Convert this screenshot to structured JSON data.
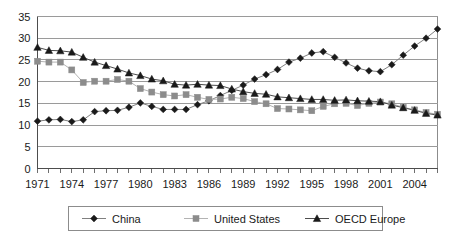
{
  "chart_data": {
    "type": "line",
    "title": "",
    "xlabel": "",
    "ylabel": "",
    "xlim": [
      1971,
      2006
    ],
    "ylim": [
      0,
      35
    ],
    "yticks": [
      0,
      5,
      10,
      15,
      20,
      25,
      30,
      35
    ],
    "xticks_major": [
      1971,
      1974,
      1977,
      1980,
      1983,
      1986,
      1989,
      1992,
      1995,
      1998,
      2001,
      2004
    ],
    "grid": "horizontal",
    "legend_position": "bottom",
    "x": [
      1971,
      1972,
      1973,
      1974,
      1975,
      1976,
      1977,
      1978,
      1979,
      1980,
      1981,
      1982,
      1983,
      1984,
      1985,
      1986,
      1987,
      1988,
      1989,
      1990,
      1991,
      1992,
      1993,
      1994,
      1995,
      1996,
      1997,
      1998,
      1999,
      2000,
      2001,
      2002,
      2003,
      2004,
      2005,
      2006
    ],
    "series": [
      {
        "name": "China",
        "marker": "diamond",
        "color": "#1a1a1a",
        "line_color": "#808080",
        "values": [
          10.9,
          11.2,
          11.3,
          10.8,
          11.2,
          13.1,
          13.3,
          13.4,
          14.1,
          15.1,
          14.3,
          13.6,
          13.6,
          13.6,
          14.7,
          15.6,
          16.8,
          18.0,
          19.2,
          20.6,
          21.6,
          22.8,
          24.5,
          25.4,
          26.6,
          26.9,
          25.6,
          24.3,
          23.1,
          22.5,
          22.3,
          23.9,
          26.1,
          28.2,
          30.0,
          32.1
        ]
      },
      {
        "name": "United States",
        "marker": "square",
        "color": "#8c8c8c",
        "line_color": "#b3b3b3",
        "values": [
          24.7,
          24.5,
          24.5,
          22.7,
          19.8,
          20.1,
          20.1,
          20.5,
          20.1,
          18.4,
          17.6,
          17.0,
          16.7,
          17.0,
          16.4,
          15.9,
          16.0,
          16.4,
          16.1,
          15.4,
          14.9,
          13.8,
          13.7,
          13.5,
          13.3,
          14.3,
          14.9,
          15.0,
          14.5,
          15.0,
          15.3,
          14.9,
          14.1,
          13.5,
          12.9,
          12.5
        ]
      },
      {
        "name": "OECD Europe",
        "marker": "triangle",
        "color": "#1a1a1a",
        "line_color": "#4d4d4d",
        "values": [
          27.9,
          27.2,
          27.1,
          26.8,
          25.6,
          24.5,
          23.7,
          22.9,
          22.0,
          21.4,
          20.6,
          20.2,
          19.4,
          19.2,
          19.4,
          19.2,
          19.1,
          18.3,
          17.7,
          17.3,
          17.1,
          16.5,
          16.3,
          16.1,
          15.9,
          15.9,
          15.7,
          15.8,
          15.6,
          15.5,
          15.4,
          14.6,
          14.0,
          13.4,
          12.7,
          12.3
        ]
      }
    ]
  },
  "legend": {
    "items": [
      {
        "label": "China"
      },
      {
        "label": "United States"
      },
      {
        "label": "OECD Europe"
      }
    ]
  }
}
